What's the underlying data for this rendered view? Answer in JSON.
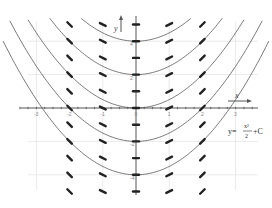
{
  "chart_data": {
    "type": "line",
    "title": "",
    "subtitle": "Slope field and solution curves of dy/dx = x",
    "xlabel": "x",
    "ylabel": "y",
    "xlim": [
      -4,
      4
    ],
    "ylim": [
      -6.5,
      6
    ],
    "grid": true,
    "x_ticks": [
      -3,
      -2,
      -1,
      0,
      1,
      2,
      3
    ],
    "x_tick_labels": [
      "-3",
      "-2",
      "-1",
      "0",
      "1",
      "2",
      "3"
    ],
    "y_ticks": [
      -5,
      -4,
      -3,
      -2,
      -1,
      0,
      1,
      2,
      3,
      4,
      5
    ],
    "y_tick_labels_visible": [
      "4",
      "2",
      "0",
      "-2",
      "-4"
    ],
    "annotation": "y = x²/2 + C",
    "series": [
      {
        "name": "C = 4",
        "formula": "y = x^2/2 + 4",
        "C": 4
      },
      {
        "name": "C = 2",
        "formula": "y = x^2/2 + 2",
        "C": 2
      },
      {
        "name": "C = 0",
        "formula": "y = x^2/2",
        "C": 0
      },
      {
        "name": "C = -2",
        "formula": "y = x^2/2 - 2",
        "C": -2
      },
      {
        "name": "C = -4",
        "formula": "y = x^2/2 - 4",
        "C": -4
      }
    ],
    "slope_field": {
      "equation": "dy/dx = x",
      "x_positions": [
        -2,
        -1,
        0,
        1,
        2
      ],
      "y_positions": [
        -5,
        -4,
        -3,
        -2,
        -1,
        0,
        1,
        2,
        3,
        4,
        5
      ]
    }
  },
  "labels": {
    "x_axis": "x",
    "y_axis": "y",
    "formula_lhs": "y=",
    "formula_num": "x²",
    "formula_den": "2",
    "formula_rhs": "+C"
  },
  "colors": {
    "curve": "#6a6a6a",
    "slope": "#222222",
    "grid": "#dcdcdc",
    "axis": "#555555"
  }
}
